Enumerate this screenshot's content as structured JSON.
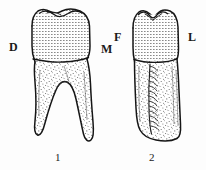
{
  "figure": {
    "caption_numbers": [
      {
        "id": "1",
        "label": "1"
      },
      {
        "id": "2",
        "label": "2"
      }
    ],
    "orientation_labels": [
      {
        "id": "D",
        "label": "D",
        "meaning": "distal",
        "belongs_to": "1"
      },
      {
        "id": "M",
        "label": "M",
        "meaning": "mesial",
        "belongs_to": "1"
      },
      {
        "id": "F",
        "label": "F",
        "meaning": "facial",
        "belongs_to": "2"
      },
      {
        "id": "L",
        "label": "L",
        "meaning": "lingual",
        "belongs_to": "2"
      }
    ],
    "specimens": [
      {
        "number": "1",
        "view": "proximal view",
        "crown_texture": "horizontal-line-stipple",
        "root_texture": "random-speckle",
        "root_count": 2
      },
      {
        "number": "2",
        "view": "proximal view",
        "crown_texture": "horizontal-line-stipple",
        "root_texture": "random-speckle",
        "root_count": 1,
        "root_feature": "vertical developmental groove with horizontal striations"
      }
    ],
    "colors": {
      "background": "#fdfdfd",
      "outline": "#1a1a1a",
      "crown_fill": "#e8e8e8",
      "root_fill": "#f2f2f2",
      "text": "#1a1a1a"
    }
  }
}
